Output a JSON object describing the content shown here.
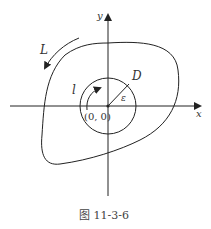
{
  "diagram": {
    "axes": {
      "x_label": "x",
      "y_label": "y"
    },
    "origin_label": "(0, 0)",
    "outer_curve_label": "L",
    "inner_circle_label": "l",
    "region_label": "D",
    "radius_label": "ε",
    "caption": "图 11-3-6",
    "colors": {
      "stroke": "#222222",
      "text": "#333333"
    }
  }
}
